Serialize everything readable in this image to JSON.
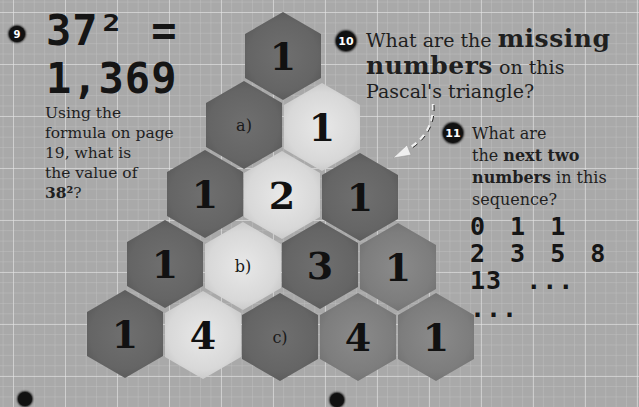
{
  "q9": {
    "number": "9",
    "equation_line1": "37² =",
    "equation_line2": "1,369",
    "text_line1": "Using the",
    "text_line2": "formula on page",
    "text_line3": "19, what is",
    "text_line4": "the value of",
    "text_bold": "38²",
    "text_end": "?"
  },
  "q10": {
    "number": "10",
    "text_pre": "What are the ",
    "text_bold1": "missing",
    "text_bold2": "numbers",
    "text_mid": " on this",
    "text_line3": "Pascal's triangle?"
  },
  "q11": {
    "number": "11",
    "text_line1": "What are",
    "text_pre": "the ",
    "text_bold1": "next two",
    "text_bold2": "numbers",
    "text_mid": " in this",
    "text_line4": "sequence?",
    "sequence_line1": "0 1 1",
    "sequence_line2": "2 3 5 8",
    "sequence_line3": "13 ... ..."
  },
  "triangle": {
    "rows": [
      [
        {
          "text": "1",
          "tone": "dark",
          "kind": "num"
        }
      ],
      [
        {
          "text": "a)",
          "tone": "dark",
          "kind": "lbl"
        },
        {
          "text": "1",
          "tone": "light",
          "kind": "num"
        }
      ],
      [
        {
          "text": "1",
          "tone": "dark",
          "kind": "num"
        },
        {
          "text": "2",
          "tone": "light",
          "kind": "num"
        },
        {
          "text": "1",
          "tone": "dark",
          "kind": "num"
        }
      ],
      [
        {
          "text": "1",
          "tone": "dark",
          "kind": "num"
        },
        {
          "text": "b)",
          "tone": "light",
          "kind": "lbl"
        },
        {
          "text": "3",
          "tone": "dark",
          "kind": "num"
        },
        {
          "text": "1",
          "tone": "mid",
          "kind": "num"
        }
      ],
      [
        {
          "text": "1",
          "tone": "dark",
          "kind": "num"
        },
        {
          "text": "4",
          "tone": "light",
          "kind": "num"
        },
        {
          "text": "c)",
          "tone": "dark",
          "kind": "lbl"
        },
        {
          "text": "4",
          "tone": "mid",
          "kind": "num"
        },
        {
          "text": "1",
          "tone": "mid",
          "kind": "num"
        }
      ]
    ]
  }
}
